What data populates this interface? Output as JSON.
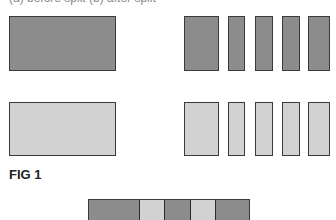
{
  "cut_text": "(a) before split (b) after split",
  "figure_label": "FIG 1",
  "colors": {
    "dark": "#8c8c8c",
    "light": "#d2d2d2",
    "border": "#3a3a3a"
  },
  "rows": [
    {
      "shade": "dark",
      "whole": {
        "x": 9,
        "y": 16,
        "w": 107,
        "h": 55
      },
      "parts": [
        {
          "x": 184,
          "w": 35
        },
        {
          "x": 228,
          "w": 17
        },
        {
          "x": 255,
          "w": 18
        },
        {
          "x": 282,
          "w": 18
        },
        {
          "x": 308,
          "w": 22
        }
      ]
    },
    {
      "shade": "light",
      "whole": {
        "x": 9,
        "y": 102,
        "w": 107,
        "h": 54
      },
      "parts": [
        {
          "x": 184,
          "w": 35
        },
        {
          "x": 228,
          "w": 17
        },
        {
          "x": 255,
          "w": 18
        },
        {
          "x": 282,
          "w": 18
        },
        {
          "x": 308,
          "w": 22
        }
      ]
    }
  ],
  "strip": [
    {
      "shade": "dark",
      "w": 52
    },
    {
      "shade": "light",
      "w": 25
    },
    {
      "shade": "dark",
      "w": 26
    },
    {
      "shade": "light",
      "w": 26
    },
    {
      "shade": "dark",
      "w": 33
    }
  ]
}
